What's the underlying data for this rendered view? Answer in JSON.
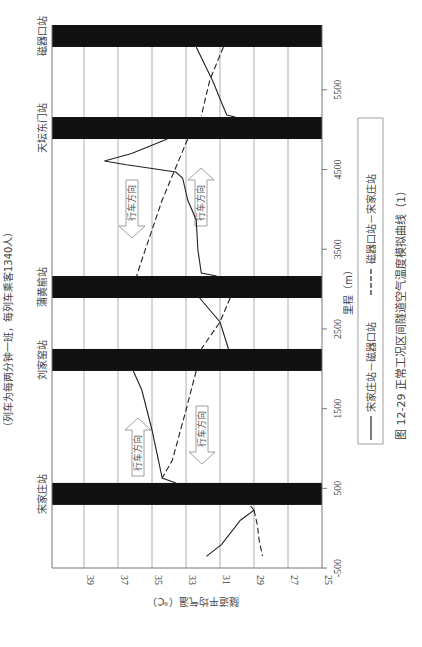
{
  "note": "（列车为每两分钟一班，每列车乘客1340人）",
  "caption": "图 12-29   正常工况区间隧道空气温度模拟曲线（1）",
  "legend": {
    "solid_label": "宋家庄站－磁器口站",
    "dashed_label": "磁器口站－宋家庄站"
  },
  "direction_label": "行车方向",
  "chart_data": {
    "type": "line",
    "title": "正常工况区间隧道空气温度模拟曲线（1）",
    "figure_number": "图 12-29",
    "orientation": "rotated 90° counter-clockwise (mileage axis vertical, temperature axis horizontal)",
    "xlabel": "里程（m）",
    "ylabel": "隧道平均气温（℃）",
    "xlim": [
      -500,
      6300
    ],
    "ylim": [
      25,
      40
    ],
    "x_ticks": [
      -500,
      500,
      1500,
      2500,
      3500,
      4500,
      5500
    ],
    "y_ticks": [
      25,
      27,
      29,
      31,
      33,
      35,
      37,
      39
    ],
    "grid": true,
    "legend_position": "right (below chart in rotated view)",
    "stations": [
      {
        "name": "宋家庄站",
        "start": 292,
        "end": 568
      },
      {
        "name": "刘家窑站",
        "start": 1973,
        "end": 2249
      },
      {
        "name": "蒲黄榆站",
        "start": 2888,
        "end": 3164
      },
      {
        "name": "天坛东门站",
        "start": 4883,
        "end": 5159
      },
      {
        "name": "磁器口站",
        "start": 6038,
        "end": 6314
      }
    ],
    "series": [
      {
        "name": "宋家庄站－磁器口站",
        "style": "solid",
        "segments": [
          [
            [
              -354,
              31.8
            ],
            [
              -203,
              30.9
            ],
            [
              101,
              29.8
            ],
            [
              227,
              29.0
            ],
            [
              279,
              29.2
            ]
          ],
          [
            [
              567,
              33.6
            ],
            [
              630,
              34.4
            ],
            [
              1232,
              35.0
            ],
            [
              1734,
              35.6
            ],
            [
              1973,
              36.1
            ]
          ],
          [
            [
              2249,
              30.5
            ],
            [
              2587,
              31.0
            ],
            [
              2888,
              32.2
            ]
          ],
          [
            [
              3164,
              31.2
            ],
            [
              3202,
              32.1
            ],
            [
              3491,
              32.3
            ],
            [
              3867,
              32.4
            ],
            [
              4118,
              32.9
            ],
            [
              4394,
              33.2
            ],
            [
              4469,
              33.6
            ],
            [
              4560,
              36.5
            ],
            [
              4607,
              37.8
            ],
            [
              4700,
              36.2
            ],
            [
              4883,
              34.1
            ]
          ],
          [
            [
              5159,
              30.1
            ],
            [
              5184,
              30.6
            ],
            [
              5335,
              30.9
            ],
            [
              5598,
              31.4
            ],
            [
              6038,
              32.4
            ]
          ]
        ]
      },
      {
        "name": "磁器口站－宋家庄站",
        "style": "dashed",
        "segments": [
          [
            [
              6038,
              30.8
            ],
            [
              5624,
              31.6
            ],
            [
              5172,
              32.1
            ]
          ],
          [
            [
              4883,
              32.9
            ],
            [
              4118,
              34.4
            ],
            [
              3365,
              35.6
            ],
            [
              3164,
              35.9
            ]
          ],
          [
            [
              2888,
              30.4
            ],
            [
              2587,
              31.0
            ],
            [
              2249,
              32.1
            ]
          ],
          [
            [
              1973,
              32.4
            ],
            [
              1483,
              33.0
            ],
            [
              855,
              33.8
            ],
            [
              630,
              34.4
            ]
          ],
          [
            [
              227,
              29.0
            ],
            [
              40,
              28.8
            ],
            [
              -148,
              28.7
            ],
            [
              -349,
              28.5
            ]
          ]
        ]
      }
    ],
    "annotations": [
      {
        "text": "行车方向",
        "direction": "toward 宋家庄 (down)",
        "between": [
          "天坛东门站",
          "蒲黄榆站"
        ],
        "series": "磁器口站－宋家庄站"
      },
      {
        "text": "行车方向",
        "direction": "toward 磁器口 (up)",
        "between": [
          "天坛东门站",
          "蒲黄榆站"
        ],
        "series": "宋家庄站－磁器口站"
      },
      {
        "text": "行车方向",
        "direction": "toward 磁器口 (up)",
        "between": [
          "宋家庄站",
          "刘家窑站"
        ],
        "series": "宋家庄站－磁器口站"
      },
      {
        "text": "行车方向",
        "direction": "toward 宋家庄 (down)",
        "between": [
          "宋家庄站",
          "刘家窑站"
        ],
        "series": "磁器口站－宋家庄站"
      }
    ]
  }
}
